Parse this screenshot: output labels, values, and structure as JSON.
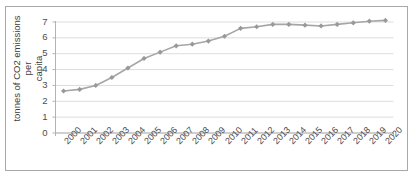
{
  "chart_data": {
    "type": "line",
    "title": "",
    "xlabel": "",
    "ylabel": "tonnes of CO2 emissions  per capita",
    "categories": [
      "2000",
      "2001",
      "2002",
      "2003",
      "2004",
      "2005",
      "2006",
      "2007",
      "2008",
      "2009",
      "2010",
      "2011",
      "2012",
      "2013",
      "2014",
      "2015",
      "2016",
      "2017",
      "2018",
      "2019",
      "2020"
    ],
    "values": [
      2.65,
      2.75,
      3.0,
      3.5,
      4.1,
      4.7,
      5.1,
      5.5,
      5.6,
      5.8,
      6.1,
      6.6,
      6.7,
      6.85,
      6.85,
      6.8,
      6.75,
      6.85,
      6.95,
      7.05,
      7.1
    ],
    "series": [
      {
        "name": "CO2 emissions per capita",
        "values": [
          2.65,
          2.75,
          3.0,
          3.5,
          4.1,
          4.7,
          5.1,
          5.5,
          5.6,
          5.8,
          6.1,
          6.6,
          6.7,
          6.85,
          6.85,
          6.8,
          6.75,
          6.85,
          6.95,
          7.05,
          7.1
        ]
      }
    ],
    "ylim": [
      0,
      7
    ],
    "yticks": [
      0,
      1,
      2,
      3,
      4,
      5,
      6,
      7
    ],
    "ytick_labels": [
      "0",
      "1",
      "2",
      "3",
      "4",
      "5",
      "6",
      "7"
    ],
    "grid": "horizontal",
    "legend": "none",
    "marker": "diamond",
    "line_color": "#a6a6a6",
    "marker_color": "#999999",
    "gridline_color": "#d9d9d9",
    "axis_color": "#b3b3b3",
    "frame_color": "#a8a8a8",
    "background": "#ffffff",
    "xtick_rotation": -45
  },
  "axis": {
    "y_title_line1": "tonnes of CO2 emissions  per",
    "y_title_line2": "capita"
  }
}
